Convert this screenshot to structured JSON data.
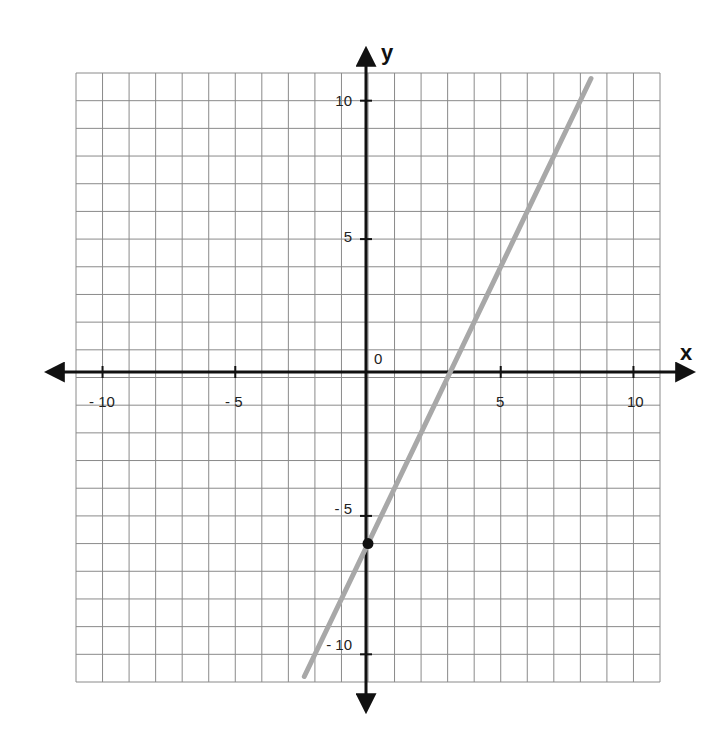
{
  "chart_data": {
    "type": "line",
    "title": "",
    "xlabel": "x",
    "ylabel": "y",
    "xlim": [
      -11,
      11
    ],
    "ylim": [
      -11,
      11
    ],
    "grid": true,
    "legend": null,
    "x_ticks": [
      -10,
      -5,
      5,
      10
    ],
    "y_ticks": [
      10,
      5,
      -5,
      -10
    ],
    "x_tick_labels": [
      "- 10",
      "- 5",
      "5",
      "10"
    ],
    "y_tick_labels": [
      "10",
      "5",
      "- 5",
      "- 10"
    ],
    "origin_label": "0",
    "series": [
      {
        "name": "line",
        "equation": "y = 2x - 6",
        "slope": 2,
        "intercept": -6,
        "color": "#a8a8a8",
        "x": [
          -2.4,
          8.4
        ],
        "y": [
          -10.8,
          10.8
        ]
      }
    ],
    "points": [
      {
        "x": 0,
        "y": -6,
        "label": "y-intercept",
        "color": "#111111"
      }
    ],
    "annotations": []
  },
  "labels": {
    "x_axis": "x",
    "y_axis": "y",
    "origin": "0",
    "xt_m10": "- 10",
    "xt_m5": "- 5",
    "xt_5": "5",
    "xt_10": "10",
    "yt_10": "10",
    "yt_5": "5",
    "yt_m5": "- 5",
    "yt_m10": "- 10"
  }
}
